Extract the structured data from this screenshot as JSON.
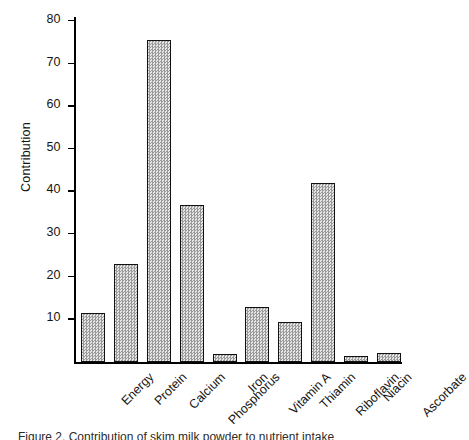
{
  "figure": {
    "caption": "Figure 2. Contribution of skim milk powder to nutrient intake"
  },
  "chart_data": {
    "type": "bar",
    "title": "",
    "xlabel": "",
    "ylabel": "Contribution",
    "categories": [
      "Energy",
      "Protein",
      "Calcium",
      "Phosphorus",
      "Iron",
      "Vitamin A",
      "Thiamin",
      "Riboflavin",
      "Niacin",
      "Ascorbate"
    ],
    "values": [
      11.5,
      23,
      75.7,
      37,
      2,
      13,
      9.5,
      42,
      1.5,
      2.3
    ],
    "ylim": [
      0,
      81
    ],
    "yticks": [
      10,
      20,
      30,
      40,
      50,
      60,
      70,
      80
    ],
    "ytick_labels": [
      "10",
      "20",
      "30",
      "40",
      "50",
      "60",
      "70",
      "80"
    ],
    "grid": false,
    "legend": false,
    "bar_fill": "#c9c9c9",
    "bar_edge": "#111111"
  }
}
